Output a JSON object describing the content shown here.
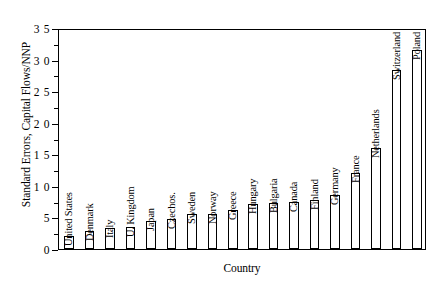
{
  "chart_data": {
    "type": "bar",
    "title": "",
    "subtitle": "",
    "xlabel": "Country",
    "ylabel": "Standard Errors, Capital Flows/NNP",
    "ylim": [
      0,
      3.5
    ],
    "yticks": [
      0,
      0.5,
      1.0,
      1.5,
      2.0,
      2.5,
      3.0,
      3.5
    ],
    "ytick_labels": [
      "0",
      "5",
      "1 0",
      "1 5",
      "2 0",
      "2 5",
      "3 0",
      "3 5"
    ],
    "grid": false,
    "legend": null,
    "bar_fill": "#ffffff",
    "bar_edge": "#000000",
    "categories": [
      "United States",
      "Denmark",
      "Italy",
      "U. Kingdom",
      "Japan",
      "Czechos.",
      "Sweden",
      "Norway",
      "Greece",
      "Hungary",
      "Bulgaria",
      "Canada",
      "Finland",
      "Germany",
      "France",
      "Netherlands",
      "Switzerland",
      "Poland"
    ],
    "values": [
      0.21,
      0.29,
      0.33,
      0.35,
      0.45,
      0.47,
      0.55,
      0.56,
      0.62,
      0.72,
      0.73,
      0.75,
      0.78,
      0.85,
      1.21,
      1.6,
      2.83,
      3.15
    ]
  }
}
